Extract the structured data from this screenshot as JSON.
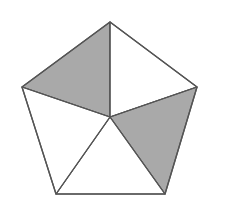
{
  "diagram": {
    "type": "pentagon-divided-into-triangles",
    "canvas": {
      "width": 228,
      "height": 213,
      "background": "#ffffff"
    },
    "vertices": {
      "top": [
        110,
        22
      ],
      "right": [
        197,
        87
      ],
      "bottom_right": [
        165,
        194
      ],
      "bottom_left": [
        56,
        194
      ],
      "left": [
        22,
        87
      ]
    },
    "center": [
      110,
      117
    ],
    "stroke_color": "#555555",
    "stroke_width": 1.2,
    "shaded_fill": "#a9a9a9",
    "unshaded_fill": "#ffffff",
    "triangles": [
      {
        "name": "top-left",
        "points": "110,22 110,117 22,87",
        "shaded": true
      },
      {
        "name": "top-right",
        "points": "110,22 197,87 110,117",
        "shaded": false
      },
      {
        "name": "right",
        "points": "197,87 165,194 110,117",
        "shaded": true
      },
      {
        "name": "bottom",
        "points": "165,194 56,194 110,117",
        "shaded": false
      },
      {
        "name": "left",
        "points": "56,194 22,87 110,117",
        "shaded": false
      }
    ],
    "shaded_count": 2,
    "total_regions": 5
  }
}
